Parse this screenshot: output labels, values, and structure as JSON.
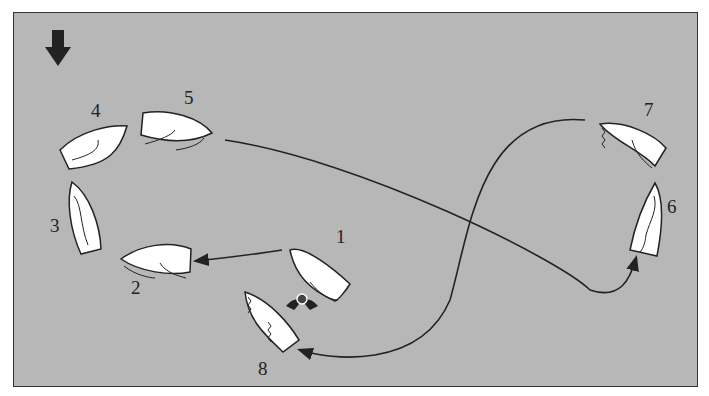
{
  "diagram": {
    "type": "sailing-manoeuvre",
    "wind_indicator": {
      "icon": "wind-arrow-down-icon"
    },
    "boats": [
      {
        "label": "1",
        "x": 318,
        "y": 268
      },
      {
        "label": "2",
        "x": 155,
        "y": 262
      },
      {
        "label": "3",
        "x": 84,
        "y": 218
      },
      {
        "label": "4",
        "x": 94,
        "y": 140
      },
      {
        "label": "5",
        "x": 176,
        "y": 128
      },
      {
        "label": "6",
        "x": 648,
        "y": 232
      },
      {
        "label": "7",
        "x": 632,
        "y": 132
      },
      {
        "label": "8",
        "x": 268,
        "y": 320
      }
    ],
    "mark": {
      "icon": "buoy-mark-icon"
    },
    "colors": {
      "background": "#b7b7b7",
      "boat": "#ffffff",
      "line": "#222222"
    }
  }
}
